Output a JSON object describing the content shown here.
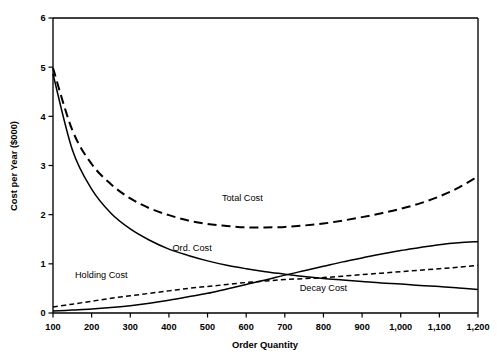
{
  "chart_data": {
    "type": "line",
    "title": "",
    "xlabel": "Order Quantity",
    "ylabel": "Cost per Year ($000)",
    "xlim": [
      100,
      1200
    ],
    "ylim": [
      0,
      6
    ],
    "grid": false,
    "legend_position": "inline-curve-labels",
    "x_ticks": [
      100,
      200,
      300,
      400,
      500,
      600,
      700,
      800,
      900,
      1000,
      1100,
      1200
    ],
    "x_tick_labels": [
      "100",
      "200",
      "300",
      "400",
      "500",
      "600",
      "700",
      "800",
      "900",
      "1,000",
      "1,100",
      "1,200"
    ],
    "y_ticks": [
      0,
      1,
      2,
      3,
      4,
      5,
      6
    ],
    "y_tick_labels": [
      "0",
      "1",
      "2",
      "3",
      "4",
      "5",
      "6"
    ],
    "x": [
      100,
      150,
      200,
      250,
      300,
      350,
      400,
      450,
      500,
      550,
      600,
      650,
      700,
      750,
      800,
      850,
      900,
      950,
      1000,
      1050,
      1100,
      1150,
      1200
    ],
    "series": [
      {
        "name": "Total Cost",
        "label": "Total Cost",
        "style": "long-dashed",
        "values": [
          4.98,
          3.72,
          3.03,
          2.62,
          2.33,
          2.13,
          1.99,
          1.88,
          1.81,
          1.77,
          1.74,
          1.74,
          1.75,
          1.78,
          1.82,
          1.88,
          1.95,
          2.03,
          2.12,
          2.23,
          2.37,
          2.55,
          2.78
        ]
      },
      {
        "name": "Ord. Cost",
        "label": "Ord. Cost",
        "style": "solid",
        "values": [
          4.86,
          3.32,
          2.52,
          2.03,
          1.71,
          1.48,
          1.3,
          1.17,
          1.06,
          0.97,
          0.9,
          0.84,
          0.79,
          0.74,
          0.7,
          0.67,
          0.64,
          0.61,
          0.59,
          0.56,
          0.54,
          0.51,
          0.48
        ]
      },
      {
        "name": "Holding Cost",
        "label": "Holding Cost",
        "style": "short-dashed",
        "values": [
          0.12,
          0.18,
          0.24,
          0.3,
          0.35,
          0.4,
          0.45,
          0.5,
          0.54,
          0.58,
          0.62,
          0.65,
          0.68,
          0.7,
          0.72,
          0.75,
          0.78,
          0.81,
          0.84,
          0.87,
          0.9,
          0.93,
          0.97
        ]
      },
      {
        "name": "Decay Cost",
        "label": "Decay Cost",
        "style": "solid",
        "values": [
          0.04,
          0.06,
          0.08,
          0.11,
          0.15,
          0.2,
          0.26,
          0.33,
          0.4,
          0.49,
          0.58,
          0.67,
          0.77,
          0.86,
          0.95,
          1.04,
          1.12,
          1.2,
          1.27,
          1.33,
          1.39,
          1.43,
          1.45
        ]
      }
    ],
    "annotations": [
      {
        "text": "Total Cost",
        "x": 590,
        "y": 2.28
      },
      {
        "text": "Ord. Cost",
        "x": 460,
        "y": 1.26
      },
      {
        "text": "Holding Cost",
        "x": 225,
        "y": 0.71
      },
      {
        "text": "Decay Cost",
        "x": 800,
        "y": 0.45
      }
    ]
  }
}
